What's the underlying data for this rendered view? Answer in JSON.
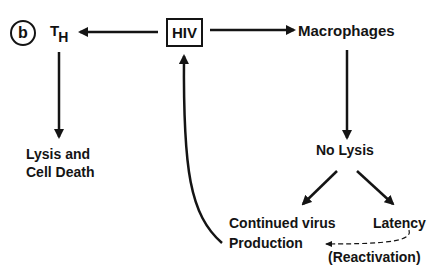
{
  "diagram": {
    "panel_label": "b",
    "nodes": {
      "th": {
        "main": "T",
        "sub": "H"
      },
      "hiv": "HIV",
      "macrophages": "Macrophages",
      "lysis_line1": "Lysis and",
      "lysis_line2": "Cell Death",
      "no_lysis": "No Lysis",
      "continued_line1": "Continued virus",
      "continued_line2": "Production",
      "latency": "Latency",
      "reactivation": "(Reactivation)"
    },
    "edges": [
      {
        "from": "HIV",
        "to": "T_H",
        "style": "solid"
      },
      {
        "from": "HIV",
        "to": "Macrophages",
        "style": "solid"
      },
      {
        "from": "T_H",
        "to": "Lysis and Cell Death",
        "style": "solid"
      },
      {
        "from": "Macrophages",
        "to": "No Lysis",
        "style": "solid"
      },
      {
        "from": "No Lysis",
        "to": "Continued virus Production",
        "style": "solid"
      },
      {
        "from": "No Lysis",
        "to": "Latency",
        "style": "solid"
      },
      {
        "from": "Latency",
        "to": "Continued virus Production",
        "style": "dashed",
        "label": "(Reactivation)"
      },
      {
        "from": "Continued virus Production",
        "to": "HIV",
        "style": "solid-curved"
      }
    ],
    "colors": {
      "ink": "#141414",
      "background": "#ffffff"
    }
  }
}
